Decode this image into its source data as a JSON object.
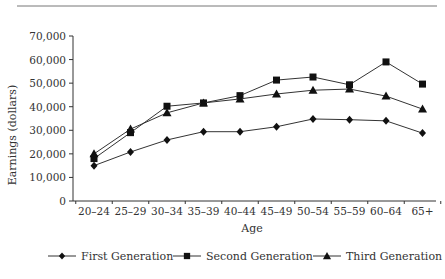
{
  "chart_data": {
    "type": "line",
    "title": "",
    "xlabel": "Age",
    "ylabel": "Earnings (dollars)",
    "ylim": [
      0,
      70000
    ],
    "yticks": [
      0,
      10000,
      20000,
      30000,
      40000,
      50000,
      60000,
      70000
    ],
    "ytick_labels": [
      "0",
      "10,000",
      "20,000",
      "30,000",
      "40,000",
      "50,000",
      "60,000",
      "70,000"
    ],
    "categories": [
      "20–24",
      "25–29",
      "30–34",
      "35–39",
      "40–44",
      "45–49",
      "50–54",
      "55–59",
      "60–64",
      "65+"
    ],
    "grid": false,
    "legend_position": "bottom",
    "series": [
      {
        "name": "First Generation",
        "marker": "diamond",
        "values": [
          15000,
          20800,
          25900,
          29400,
          29400,
          31500,
          34800,
          34500,
          34000,
          28800
        ]
      },
      {
        "name": "Second Generation",
        "marker": "square",
        "values": [
          18000,
          29000,
          40200,
          41600,
          44700,
          51300,
          52600,
          49300,
          59000,
          49600
        ]
      },
      {
        "name": "Third Generation",
        "marker": "triangle",
        "values": [
          20000,
          30500,
          37400,
          41600,
          43300,
          45400,
          47000,
          47500,
          44500,
          39000
        ]
      }
    ]
  },
  "colors": {
    "line": "#333333",
    "marker": "#111111",
    "axis": "#333333"
  }
}
